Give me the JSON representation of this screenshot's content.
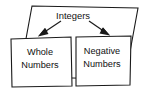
{
  "diagram": {
    "type": "set-containment-diagram",
    "outer_set": {
      "label": "Integers",
      "shape": "quadrilateral"
    },
    "inner_sets": [
      {
        "id": "whole-numbers",
        "label_line1": "Whole",
        "label_line2": "Numbers"
      },
      {
        "id": "negative-numbers",
        "label_line1": "Negative",
        "label_line2": "Numbers"
      }
    ],
    "arrows": [
      {
        "id": "arrow-to-whole-numbers",
        "from": "Integers",
        "to": "Whole Numbers",
        "direction": "down-left"
      },
      {
        "id": "arrow-to-negative-numbers",
        "from": "Integers",
        "to": "Negative Numbers",
        "direction": "down-right"
      }
    ],
    "colors": {
      "stroke": "#1a1a1a",
      "fill": "#ffffff",
      "text": "#111111"
    }
  }
}
